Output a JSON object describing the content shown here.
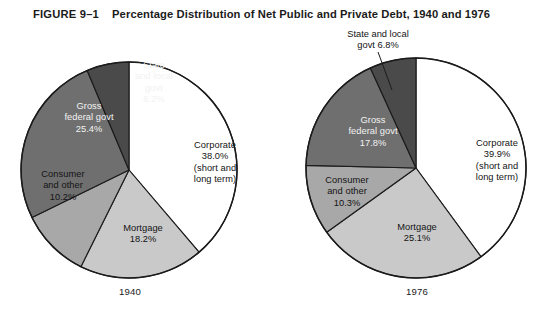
{
  "figure": {
    "number": "FIGURE 9–1",
    "title": "Percentage Distribution of Net Public and Private Debt, 1940 and 1976"
  },
  "chart_data": [
    {
      "type": "pie",
      "title": "1940",
      "caption": "1940",
      "labels": [
        "Corporate (short and long term)",
        "Mortgage",
        "Consumer and other",
        "Gross federal govt",
        "State and local govt"
      ],
      "values": [
        38.0,
        18.2,
        10.2,
        25.4,
        6.2
      ],
      "colors": [
        "#ffffff",
        "#c9c9c9",
        "#a8a8a8",
        "#6f6f6f",
        "#4a4a4a"
      ],
      "slices": [
        {
          "name": "corporate",
          "label": "Corporate\n38.0%\n(short and\nlong term)",
          "value": 38.0,
          "value_text": "38.0%",
          "color": "#ffffff",
          "text_on": "light"
        },
        {
          "name": "mortgage",
          "label": "Mortgage\n18.2%",
          "value": 18.2,
          "value_text": "18.2%",
          "color": "#c9c9c9",
          "text_on": "light"
        },
        {
          "name": "consumer-and-other",
          "label": "Consumer\nand other\n10.2%",
          "value": 10.2,
          "value_text": "10.2%",
          "color": "#a8a8a8",
          "text_on": "light"
        },
        {
          "name": "gross-federal-govt",
          "label": "Gross\nfederal govt\n25.4%",
          "value": 25.4,
          "value_text": "25.4%",
          "color": "#6f6f6f",
          "text_on": "dark"
        },
        {
          "name": "state-and-local-govt",
          "label": "State\nand local\ngovt\n6.2%",
          "value": 6.2,
          "value_text": "6.2%",
          "color": "#4a4a4a",
          "text_on": "dark"
        }
      ],
      "start_angle_deg": 0,
      "direction": "clockwise",
      "legend": "none",
      "grid": false
    },
    {
      "type": "pie",
      "title": "1976",
      "caption": "1976",
      "labels": [
        "Corporate (short and long term)",
        "Mortgage",
        "Consumer and other",
        "Gross federal govt",
        "State and local govt"
      ],
      "values": [
        39.9,
        25.1,
        10.3,
        17.8,
        6.8
      ],
      "colors": [
        "#ffffff",
        "#c9c9c9",
        "#a8a8a8",
        "#6f6f6f",
        "#4a4a4a"
      ],
      "slices": [
        {
          "name": "corporate",
          "label": "Corporate\n39.9%\n(short and\nlong term)",
          "value": 39.9,
          "value_text": "39.9%",
          "color": "#ffffff",
          "text_on": "light"
        },
        {
          "name": "mortgage",
          "label": "Mortgage\n25.1%",
          "value": 25.1,
          "value_text": "25.1%",
          "color": "#c9c9c9",
          "text_on": "light"
        },
        {
          "name": "consumer-and-other",
          "label": "Consumer\nand other\n10.3%",
          "value": 10.3,
          "value_text": "10.3%",
          "color": "#a8a8a8",
          "text_on": "light"
        },
        {
          "name": "gross-federal-govt",
          "label": "Gross\nfederal govt\n17.8%",
          "value": 17.8,
          "value_text": "17.8%",
          "color": "#6f6f6f",
          "text_on": "dark"
        },
        {
          "name": "state-and-local-govt",
          "label": "State and local\ngovt 6.8%",
          "value": 6.8,
          "value_text": "6.8%",
          "color": "#4a4a4a",
          "text_on": "light",
          "callout": true
        }
      ],
      "start_angle_deg": 0,
      "direction": "clockwise",
      "legend": "none",
      "grid": false
    }
  ],
  "labels": {
    "left": {
      "corporate": "Corporate\n38.0%\n(short and\nlong term)",
      "mortgage": "Mortgage\n18.2%",
      "consumer": "Consumer\nand other\n10.2%",
      "federal": "Gross\nfederal govt\n25.4%",
      "state": "State\nand local\ngovt\n6.2%",
      "year": "1940"
    },
    "right": {
      "corporate": "Corporate\n39.9%\n(short and\nlong term)",
      "mortgage": "Mortgage\n25.1%",
      "consumer": "Consumer\nand other\n10.3%",
      "federal": "Gross\nfederal govt\n17.8%",
      "state": "State and local\ngovt 6.8%",
      "year": "1976"
    }
  },
  "style": {
    "stroke": "#1b1b1b",
    "background": "#ffffff"
  }
}
